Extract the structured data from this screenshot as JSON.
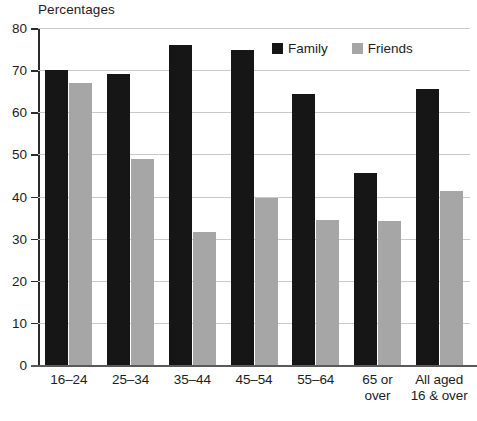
{
  "chart_data": {
    "type": "bar",
    "title": "",
    "ylabel": "Percentages",
    "xlabel": "",
    "ylim": [
      0,
      80
    ],
    "ytick_step": 10,
    "yticks": [
      "80",
      "70",
      "60",
      "50",
      "40",
      "30",
      "20",
      "10",
      "0"
    ],
    "grid": true,
    "legend_position": "inside-top-center",
    "categories": [
      "16–24",
      "25–34",
      "35–44",
      "45–54",
      "55–64",
      "65 or\nover",
      "All aged\n16 & over"
    ],
    "category_lines": [
      [
        "16–24"
      ],
      [
        "25–34"
      ],
      [
        "35–44"
      ],
      [
        "45–54"
      ],
      [
        "55–64"
      ],
      [
        "65 or",
        "over"
      ],
      [
        "All aged",
        "16 & over"
      ]
    ],
    "series": [
      {
        "name": "Family",
        "color": "#161616",
        "values": [
          70.0,
          69.0,
          76.0,
          74.8,
          64.3,
          45.5,
          65.5
        ]
      },
      {
        "name": "Friends",
        "color": "#a6a6a6",
        "values": [
          67.0,
          49.0,
          31.5,
          39.7,
          34.5,
          34.2,
          41.3
        ]
      }
    ]
  },
  "legend": {
    "items": [
      {
        "label": "Family",
        "color": "#161616"
      },
      {
        "label": "Friends",
        "color": "#a6a6a6"
      }
    ]
  },
  "colors": {
    "family": "#161616",
    "friends": "#a6a6a6",
    "gridline": "#c9c9c9",
    "axis": "#2b2b2b",
    "text": "#1d1d1d",
    "background": "#ffffff"
  },
  "scan_artifact_text": ""
}
